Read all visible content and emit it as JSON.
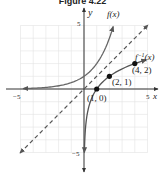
{
  "title": "Figure 4.22",
  "chart_data": {
    "type": "line",
    "title": "Figure 4.22",
    "xlabel": "x",
    "ylabel": "y",
    "xlim": [
      -5,
      5
    ],
    "ylim": [
      -5,
      5
    ],
    "grid": true,
    "x_tick_labels": [
      "-5",
      "5"
    ],
    "y_tick_labels": [
      "5",
      "-5"
    ],
    "series": [
      {
        "name": "f(x)",
        "label": "f(x)",
        "style": "solid",
        "color": "#555555",
        "description": "f(x) = 2^x",
        "x": [
          -5,
          -4,
          -3,
          -2,
          -1,
          0,
          1,
          2,
          2.3
        ],
        "y": [
          0.03,
          0.06,
          0.13,
          0.25,
          0.5,
          1,
          2,
          4,
          4.9
        ]
      },
      {
        "name": "f^-1(x)",
        "label": "f⁻¹(x)",
        "style": "solid",
        "color": "#555555",
        "description": "f^-1(x) = log2(x)",
        "x": [
          0.03,
          0.06,
          0.13,
          0.25,
          0.5,
          1,
          2,
          4,
          4.9
        ],
        "y": [
          -5,
          -4,
          -3,
          -2,
          -1,
          0,
          1,
          2,
          2.3
        ]
      },
      {
        "name": "y = x",
        "label": "",
        "style": "dashed",
        "color": "#555555",
        "x": [
          -5,
          5
        ],
        "y": [
          -5,
          5
        ]
      }
    ],
    "points": [
      {
        "label": "(1, 0)",
        "x": 1,
        "y": 0
      },
      {
        "label": "(2, 1)",
        "x": 2,
        "y": 1
      },
      {
        "label": "(4, 2)",
        "x": 4,
        "y": 2
      }
    ]
  },
  "labels": {
    "f": "f(x)",
    "finv_f": "f",
    "finv_sup": "−1",
    "finv_x": "(x)",
    "x_axis": "x",
    "y_axis": "y",
    "xmin": "−5",
    "xmax": "5",
    "ymax": "5",
    "ymin": "−5",
    "p1": "(1, 0)",
    "p2": "(2, 1)",
    "p3": "(4, 2)"
  }
}
